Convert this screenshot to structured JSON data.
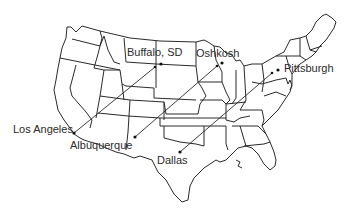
{
  "map": {
    "title": "",
    "region": "Contiguous United States",
    "style": {
      "line_color": "#2a2a2a",
      "background": "#ffffff"
    },
    "cities": [
      {
        "id": "buffalo",
        "label": "Buffalo, SD",
        "x": 161,
        "y": 64,
        "label_x": 127,
        "label_y": 47
      },
      {
        "id": "oshkosh",
        "label": "Oshkosh",
        "x": 222,
        "y": 63,
        "label_x": 196,
        "label_y": 48
      },
      {
        "id": "pittsburgh",
        "label": "Pittsburgh",
        "x": 278,
        "y": 70,
        "label_x": 284,
        "label_y": 63
      },
      {
        "id": "los_angeles",
        "label": "Los Angeles",
        "x": 74,
        "y": 133,
        "label_x": 13,
        "label_y": 124
      },
      {
        "id": "albuquerque",
        "label": "Albuquerque",
        "x": 135,
        "y": 137,
        "label_x": 70,
        "label_y": 140
      },
      {
        "id": "dallas",
        "label": "Dallas",
        "x": 180,
        "y": 152,
        "label_x": 157,
        "label_y": 155
      }
    ],
    "routes": [
      {
        "from": "Los Angeles",
        "to": "Buffalo, SD",
        "x1": 74,
        "y1": 133,
        "x2": 155,
        "y2": 67
      },
      {
        "from": "Albuquerque",
        "to": "Oshkosh",
        "x1": 135,
        "y1": 137,
        "x2": 217,
        "y2": 66
      },
      {
        "from": "Dallas",
        "to": "Pittsburgh",
        "x1": 180,
        "y1": 152,
        "x2": 272,
        "y2": 73
      }
    ]
  }
}
